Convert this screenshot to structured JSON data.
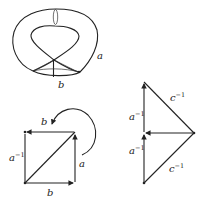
{
  "figure": {
    "torus": {
      "labels": {
        "a": "a",
        "b": "b"
      }
    },
    "square": {
      "labels": {
        "top": "b",
        "left": "a",
        "left_sup": "−1",
        "right": "a",
        "bottom": "b"
      }
    },
    "triangles": {
      "labels": {
        "upper_hyp": "c",
        "upper_hyp_sup": "−1",
        "upper_left": "a",
        "upper_left_sup": "−1",
        "lower_left": "a",
        "lower_left_sup": "−1",
        "lower_hyp": "c",
        "lower_hyp_sup": "−1"
      }
    },
    "colors": {
      "ink": "#222222",
      "background": "#ffffff"
    }
  }
}
